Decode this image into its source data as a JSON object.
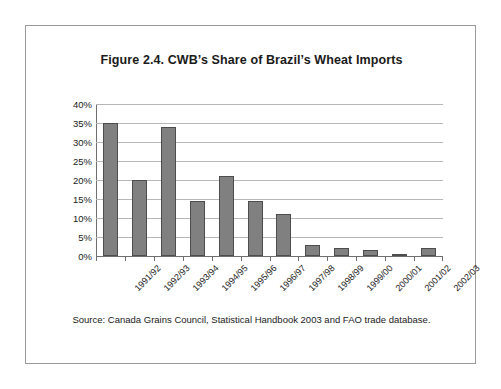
{
  "page": {
    "background_color": "#ffffff",
    "frame_color": "#9a9a9a"
  },
  "figure": {
    "title": "Figure 2.4. CWB’s Share of Brazil’s Wheat Imports",
    "source_note": "Source: Canada Grains Council, Statistical Handbook 2003 and FAO trade database."
  },
  "chart_data": {
    "type": "bar",
    "title": "Figure 2.4. CWB’s Share of Brazil’s Wheat Imports",
    "xlabel": "",
    "ylabel": "",
    "categories": [
      "1991/92",
      "1992/93",
      "1993/94",
      "1994/95",
      "1995/96",
      "1996/97",
      "1997/98",
      "1998/99",
      "1999/00",
      "2000/01",
      "2001/02",
      "2002/03"
    ],
    "values": [
      35,
      20,
      34,
      14.5,
      21,
      14.5,
      11,
      3,
      2,
      1.5,
      0.5,
      2
    ],
    "ylim": [
      0,
      40
    ],
    "ytick_values": [
      0,
      5,
      10,
      15,
      20,
      25,
      30,
      35,
      40
    ],
    "ytick_labels": [
      "0%",
      "5%",
      "10%",
      "15%",
      "20%",
      "25%",
      "30%",
      "35%",
      "40%"
    ],
    "grid": true,
    "legend": false,
    "bar_fill_color": "#808080",
    "bar_border_color": "#4d4d4d",
    "gridline_color": "#b7b7b7",
    "axis_color": "#6e6e6e"
  }
}
